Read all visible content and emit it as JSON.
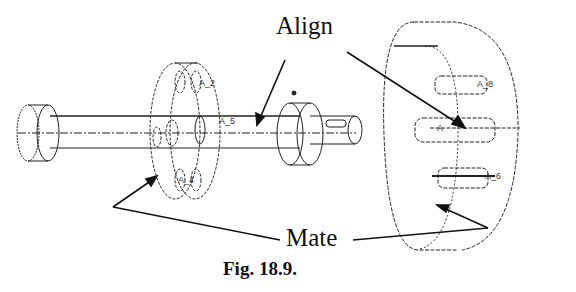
{
  "figure": {
    "caption": "Fig. 18.9.",
    "callouts": {
      "align": "Align",
      "mate": "Mate"
    },
    "axis_labels": {
      "a2": "A_2",
      "a5": "A_5",
      "a8": "A_8",
      "a6": "A_6",
      "a4": "A_4",
      "a1": "A",
      "a3": "A_3"
    },
    "parts": [
      "left collar",
      "shaft",
      "flange disc",
      "hub collar",
      "large housing"
    ]
  }
}
